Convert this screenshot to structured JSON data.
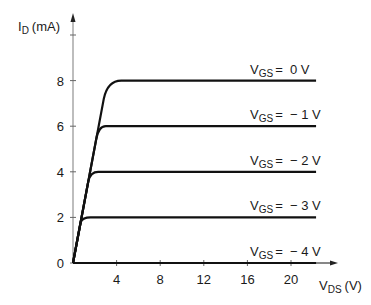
{
  "chart_data": {
    "type": "line",
    "title": "",
    "xlabel": "V_DS (V)",
    "ylabel": "I_D (mA)",
    "xlabel_main": "V",
    "xlabel_sub": "DS",
    "xlabel_unit": "(V)",
    "ylabel_main": "I",
    "ylabel_sub": "D",
    "ylabel_unit": "(mA)",
    "xlim": [
      0,
      24
    ],
    "ylim": [
      0,
      10
    ],
    "x_ticks": [
      4,
      8,
      12,
      16,
      20
    ],
    "y_ticks": [
      0,
      2,
      4,
      6,
      8
    ],
    "y_unlabeled_ticks": [
      10
    ],
    "grid": false,
    "legend": "inline labels above each curve",
    "series": [
      {
        "name": "V_GS = 0 V",
        "label_main": "V",
        "label_sub": "GS",
        "label_value": "=  0 V",
        "saturation_current": 8,
        "knee_vds": 4.4,
        "x": [
          0,
          3.0,
          4.4,
          22
        ],
        "y": [
          0,
          7.5,
          8,
          8
        ]
      },
      {
        "name": "V_GS = -1 V",
        "label_main": "V",
        "label_sub": "GS",
        "label_value": "=  − 1 V",
        "saturation_current": 6,
        "knee_vds": 3.2,
        "x": [
          0,
          2.3,
          3.2,
          22
        ],
        "y": [
          0,
          5.6,
          6,
          6
        ]
      },
      {
        "name": "V_GS = -2 V",
        "label_main": "V",
        "label_sub": "GS",
        "label_value": "=  − 2 V",
        "saturation_current": 4,
        "knee_vds": 2.3,
        "x": [
          0,
          1.5,
          2.3,
          22
        ],
        "y": [
          0,
          3.7,
          4,
          4
        ]
      },
      {
        "name": "V_GS = -3 V",
        "label_main": "V",
        "label_sub": "GS",
        "label_value": "=  − 3 V",
        "saturation_current": 2,
        "knee_vds": 1.5,
        "x": [
          0,
          0.8,
          1.5,
          22
        ],
        "y": [
          0,
          1.7,
          2,
          2
        ]
      },
      {
        "name": "V_GS = -4 V",
        "label_main": "V",
        "label_sub": "GS",
        "label_value": "=  − 4 V",
        "saturation_current": 0,
        "knee_vds": 0,
        "x": [
          0,
          22
        ],
        "y": [
          0,
          0
        ]
      }
    ]
  },
  "colors": {
    "curve": "#111111",
    "axis": "#9a9a9a",
    "axis_x": "#111111",
    "text": "#1a1a1a"
  }
}
